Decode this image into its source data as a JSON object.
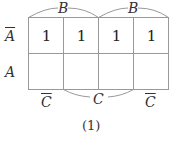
{
  "top_labels": [
    {
      "var": "B",
      "complemented": true
    },
    {
      "var": "B",
      "complemented": false
    }
  ],
  "bottom_labels": [
    {
      "var": "C",
      "complemented": true
    },
    {
      "var": "C",
      "complemented": false
    },
    {
      "var": "C",
      "complemented": true
    }
  ],
  "row_labels": [
    {
      "var": "A",
      "complemented": true
    },
    {
      "var": "A",
      "complemented": false
    }
  ],
  "cells": [
    [
      "1",
      "1",
      "1",
      "1"
    ],
    [
      "",
      "",
      "",
      ""
    ]
  ],
  "caption": "(1)"
}
